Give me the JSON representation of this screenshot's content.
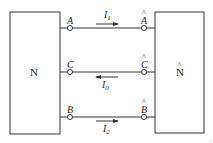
{
  "diagram": {
    "left_network": {
      "label": "N"
    },
    "right_network": {
      "label": "N",
      "hat": "^"
    },
    "lines": [
      {
        "id": "A",
        "left_terminal": "A",
        "right_terminal": "A",
        "current": "I",
        "current_sub": "1",
        "direction": "right"
      },
      {
        "id": "C",
        "left_terminal": "C",
        "right_terminal": "C",
        "current": "I",
        "current_sub": "0",
        "direction": "left"
      },
      {
        "id": "B",
        "left_terminal": "B",
        "right_terminal": "B",
        "current": "I",
        "current_sub": "2",
        "direction": "right"
      }
    ],
    "hat_glyph": "^",
    "colors": {
      "stroke": "#333333",
      "text": "#222222"
    }
  }
}
